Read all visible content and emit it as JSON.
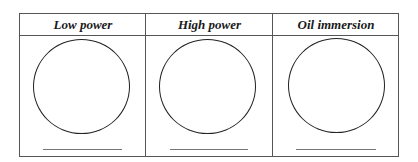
{
  "table": {
    "columns": [
      {
        "label": "Low power"
      },
      {
        "label": "High power"
      },
      {
        "label": "Oil immersion"
      }
    ]
  }
}
